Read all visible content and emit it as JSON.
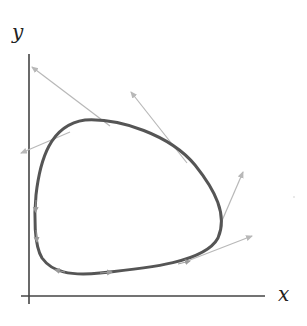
{
  "diagram": {
    "axes": {
      "x_label": "x",
      "y_label": "y"
    },
    "colors": {
      "axis": "#444444",
      "orbit": "#555555",
      "vectors": "#b8b8b8"
    },
    "orbit": {
      "shape": "closed rounded-triangular loop",
      "direction": "counterclockwise"
    },
    "tangent_vectors": [
      {
        "from": [
          110,
          126
        ],
        "to": [
          32,
          67
        ]
      },
      {
        "from": [
          70,
          132
        ],
        "to": [
          20,
          153
        ]
      },
      {
        "from": [
          187,
          163
        ],
        "to": [
          131,
          92
        ]
      },
      {
        "from": [
          221,
          223
        ],
        "to": [
          243,
          172
        ]
      },
      {
        "from": [
          190,
          260
        ],
        "to": [
          252,
          236
        ]
      }
    ]
  }
}
